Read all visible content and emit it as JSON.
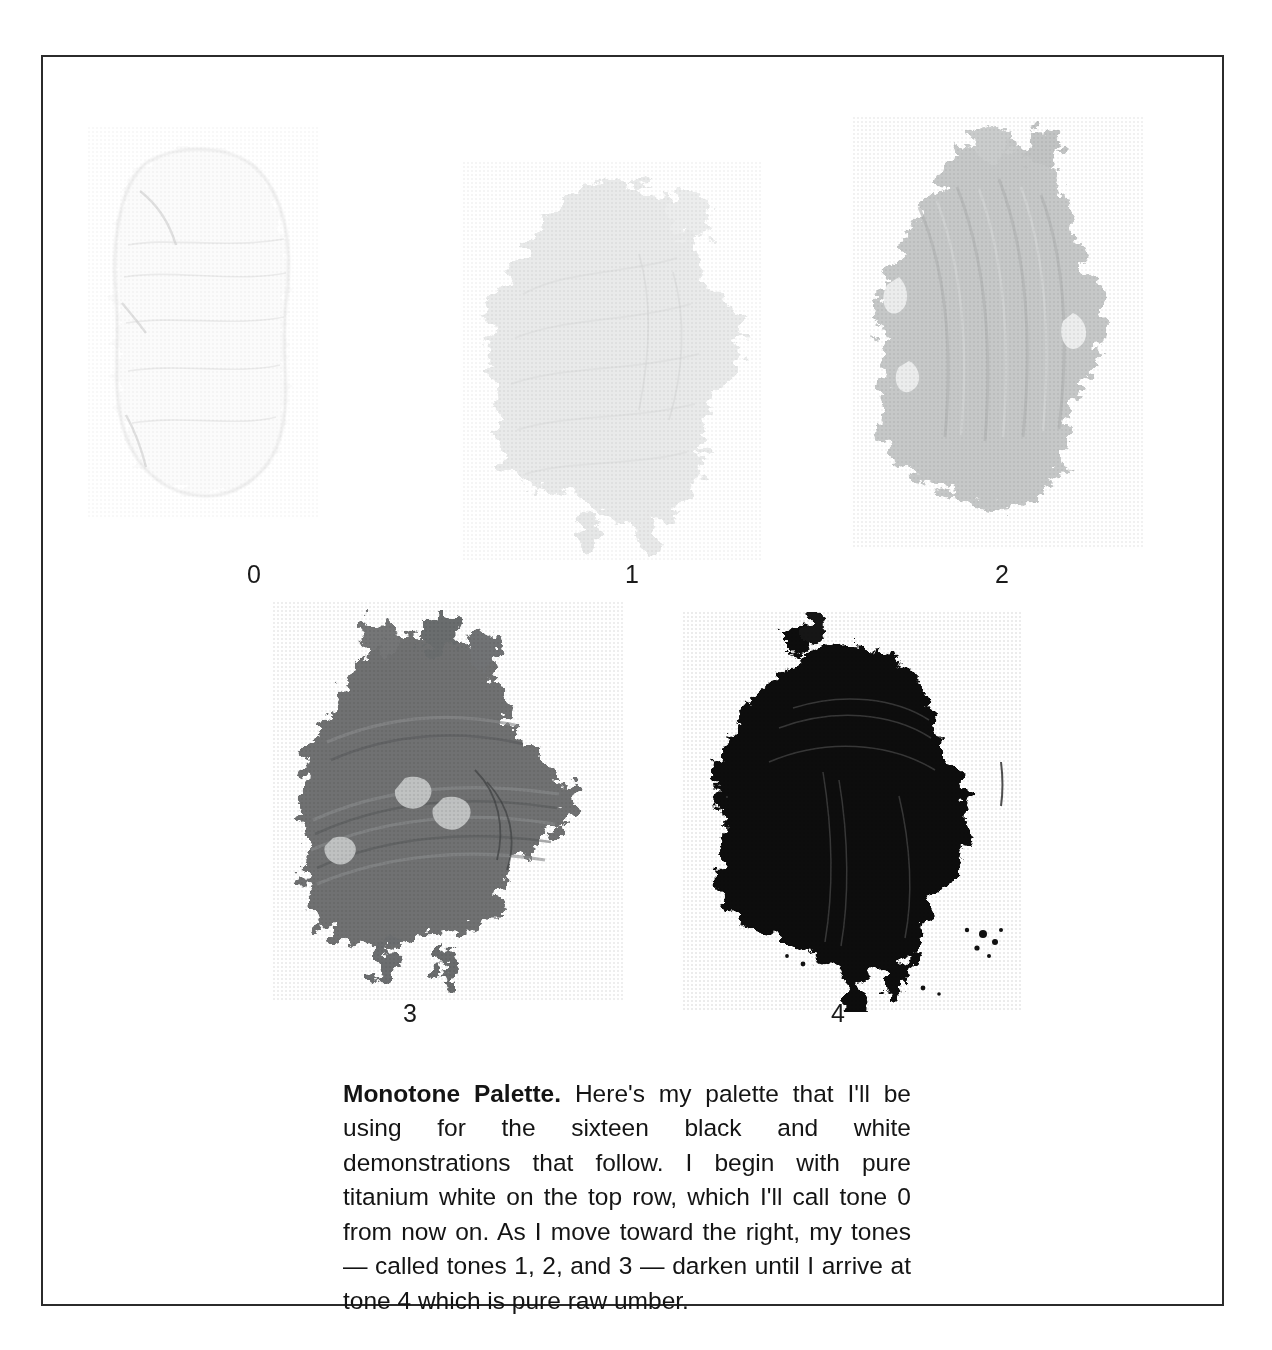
{
  "page": {
    "background_color": "#ffffff",
    "frame_border_color": "#2b2b2b"
  },
  "plate": {
    "swatches": [
      {
        "label": "0",
        "tone_name": "tone 0",
        "description": "pure titanium white paint smear",
        "color": "#fbfbfb",
        "edge_color": "#ededed"
      },
      {
        "label": "1",
        "tone_name": "tone 1",
        "description": "very light gray paint smear",
        "color": "#e9eaea",
        "edge_color": "#dddede"
      },
      {
        "label": "2",
        "tone_name": "tone 2",
        "description": "light middle gray paint smear",
        "color": "#c6c8c8",
        "edge_color": "#b6b8b8"
      },
      {
        "label": "3",
        "tone_name": "tone 3",
        "description": "dark middle gray paint smear",
        "color": "#6f7172",
        "edge_color": "#5d5f60"
      },
      {
        "label": "4",
        "tone_name": "tone 4",
        "description": "pure raw umber, near black paint smear",
        "color": "#111111",
        "edge_color": "#070707"
      }
    ]
  },
  "caption": {
    "lead": "Monotone Palette.",
    "body": " Here's my palette that I'll be using for the sixteen black and white demonstrations that follow. I begin with pure titanium white on the top row, which I'll call tone 0 from now on. As I move toward the right, my tones — called tones 1, 2, and 3 — darken until I arrive at tone 4 which is pure raw umber."
  }
}
